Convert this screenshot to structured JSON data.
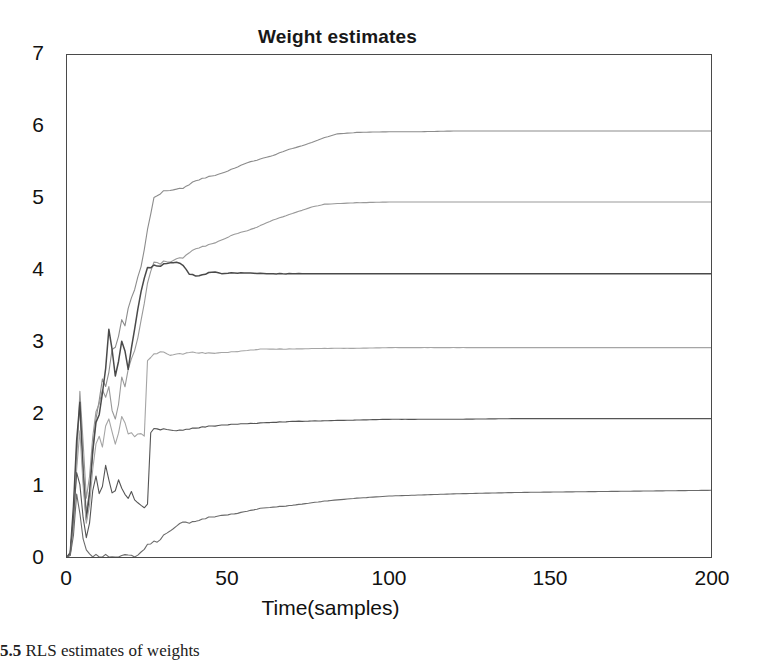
{
  "figure": {
    "caption_number": "5.5",
    "caption_text": "RLS estimates of weights"
  },
  "chart_data": {
    "type": "line",
    "title": "Weight estimates",
    "xlabel": "Time(samples)",
    "ylabel": "",
    "xlim": [
      0,
      200
    ],
    "ylim": [
      0,
      7
    ],
    "xticks": [
      0,
      50,
      100,
      150,
      200
    ],
    "xtick_labels": [
      "0",
      "50",
      "100",
      "150",
      "200"
    ],
    "yticks": [
      0,
      1,
      2,
      3,
      4,
      5,
      6,
      7
    ],
    "ytick_labels": [
      "0",
      "1",
      "2",
      "3",
      "4",
      "5",
      "6",
      "7"
    ],
    "grid": false,
    "legend": false,
    "legend_position": "none",
    "series": [
      {
        "name": "w1",
        "color": "#8c8c8c",
        "final_value": 5.94,
        "x": [
          0,
          1,
          2,
          3,
          4,
          5,
          6,
          7,
          8,
          9,
          10,
          11,
          12,
          13,
          14,
          15,
          16,
          17,
          18,
          19,
          20,
          21,
          22,
          23,
          24,
          25,
          26,
          27,
          28,
          29,
          30,
          32,
          34,
          36,
          38,
          40,
          44,
          48,
          52,
          56,
          60,
          64,
          68,
          72,
          76,
          80,
          84,
          90,
          100,
          110,
          120,
          130,
          140,
          150,
          160,
          170,
          180,
          190,
          200
        ],
        "y": [
          0,
          0.05,
          0.6,
          1.5,
          2.1,
          1.3,
          0.6,
          0.9,
          1.5,
          1.9,
          2.2,
          2.5,
          2.35,
          2.6,
          2.9,
          2.95,
          3.1,
          3.3,
          3.2,
          3.45,
          3.6,
          3.75,
          3.9,
          4.05,
          4.3,
          4.55,
          4.8,
          5.0,
          5.05,
          5.08,
          5.1,
          5.1,
          5.12,
          5.15,
          5.2,
          5.25,
          5.3,
          5.35,
          5.42,
          5.5,
          5.55,
          5.6,
          5.67,
          5.72,
          5.78,
          5.85,
          5.9,
          5.92,
          5.93,
          5.93,
          5.94,
          5.94,
          5.94,
          5.94,
          5.94,
          5.94,
          5.94,
          5.94,
          5.94
        ]
      },
      {
        "name": "w2",
        "color": "#999999",
        "final_value": 4.95,
        "x": [
          0,
          1,
          2,
          3,
          4,
          5,
          6,
          7,
          8,
          9,
          10,
          11,
          12,
          13,
          14,
          15,
          16,
          17,
          18,
          19,
          20,
          21,
          22,
          23,
          24,
          25,
          26,
          27,
          28,
          29,
          30,
          32,
          34,
          36,
          38,
          40,
          44,
          48,
          52,
          56,
          60,
          64,
          68,
          72,
          76,
          80,
          90,
          100,
          120,
          140,
          160,
          180,
          200
        ],
        "y": [
          0,
          0.04,
          0.5,
          1.3,
          2.3,
          1.6,
          0.8,
          1.1,
          1.7,
          2.0,
          2.15,
          2.35,
          2.2,
          2.4,
          2.05,
          1.95,
          2.15,
          2.5,
          2.35,
          2.6,
          2.75,
          2.9,
          3.05,
          3.3,
          3.55,
          3.8,
          4.0,
          4.1,
          4.12,
          4.1,
          4.12,
          4.1,
          4.15,
          4.18,
          4.25,
          4.3,
          4.35,
          4.42,
          4.5,
          4.55,
          4.62,
          4.7,
          4.76,
          4.82,
          4.88,
          4.92,
          4.94,
          4.95,
          4.95,
          4.95,
          4.95,
          4.95,
          4.95
        ]
      },
      {
        "name": "w3",
        "color": "#4a4a4a",
        "final_value": 3.95,
        "x": [
          0,
          1,
          2,
          3,
          4,
          5,
          6,
          7,
          8,
          9,
          10,
          11,
          12,
          13,
          14,
          15,
          16,
          17,
          18,
          19,
          20,
          21,
          22,
          23,
          24,
          25,
          26,
          27,
          28,
          29,
          30,
          32,
          34,
          36,
          38,
          40,
          42,
          44,
          46,
          48,
          50,
          54,
          58,
          62,
          66,
          70,
          80,
          90,
          100,
          120,
          140,
          160,
          180,
          200
        ],
        "y": [
          0,
          0.06,
          0.7,
          1.6,
          2.15,
          1.15,
          0.5,
          0.85,
          1.5,
          1.85,
          2.0,
          2.3,
          2.6,
          3.2,
          2.9,
          2.55,
          2.75,
          3.0,
          2.85,
          2.6,
          2.9,
          3.2,
          3.45,
          3.7,
          3.9,
          4.02,
          4.05,
          4.06,
          4.07,
          4.07,
          4.08,
          4.09,
          4.1,
          4.08,
          3.95,
          3.92,
          3.93,
          3.96,
          3.98,
          3.95,
          3.96,
          3.96,
          3.96,
          3.95,
          3.95,
          3.95,
          3.95,
          3.95,
          3.95,
          3.95,
          3.95,
          3.95,
          3.95,
          3.95
        ]
      },
      {
        "name": "w4",
        "color": "#a5a5a5",
        "final_value": 2.92,
        "x": [
          0,
          1,
          2,
          3,
          4,
          5,
          6,
          7,
          8,
          9,
          10,
          11,
          12,
          13,
          14,
          15,
          16,
          17,
          18,
          19,
          20,
          21,
          22,
          23,
          24,
          25,
          26,
          27,
          28,
          29,
          30,
          32,
          34,
          36,
          38,
          40,
          44,
          48,
          52,
          56,
          60,
          70,
          80,
          90,
          100,
          120,
          140,
          160,
          180,
          200
        ],
        "y": [
          0,
          0.03,
          0.45,
          1.2,
          1.75,
          1.0,
          0.45,
          0.7,
          1.25,
          1.55,
          1.7,
          1.55,
          1.8,
          1.95,
          1.75,
          1.6,
          1.75,
          1.95,
          1.85,
          1.7,
          1.72,
          1.7,
          1.71,
          1.72,
          1.7,
          2.72,
          2.8,
          2.82,
          2.85,
          2.88,
          2.85,
          2.8,
          2.82,
          2.84,
          2.86,
          2.85,
          2.84,
          2.85,
          2.86,
          2.88,
          2.9,
          2.9,
          2.91,
          2.91,
          2.92,
          2.92,
          2.92,
          2.92,
          2.92,
          2.92
        ]
      },
      {
        "name": "w5",
        "color": "#555555",
        "final_value": 1.93,
        "x": [
          0,
          1,
          2,
          3,
          4,
          5,
          6,
          7,
          8,
          9,
          10,
          11,
          12,
          13,
          14,
          15,
          16,
          17,
          18,
          19,
          20,
          21,
          22,
          23,
          24,
          25,
          26,
          27,
          28,
          30,
          32,
          34,
          36,
          40,
          44,
          48,
          52,
          56,
          60,
          70,
          80,
          90,
          100,
          120,
          140,
          160,
          180,
          200
        ],
        "y": [
          0,
          0.05,
          0.55,
          1.15,
          1.0,
          0.55,
          0.25,
          0.45,
          0.95,
          1.1,
          0.9,
          1.0,
          1.25,
          1.1,
          0.9,
          0.95,
          1.1,
          0.95,
          0.85,
          0.8,
          0.9,
          0.82,
          0.75,
          0.72,
          0.7,
          0.72,
          1.75,
          1.78,
          1.8,
          1.78,
          1.76,
          1.75,
          1.78,
          1.8,
          1.82,
          1.84,
          1.85,
          1.86,
          1.87,
          1.89,
          1.9,
          1.91,
          1.92,
          1.92,
          1.93,
          1.93,
          1.93,
          1.93
        ]
      },
      {
        "name": "w6",
        "color": "#6b6b6b",
        "final_value": 0.93,
        "x": [
          0,
          1,
          2,
          3,
          4,
          5,
          6,
          7,
          8,
          9,
          10,
          12,
          14,
          16,
          18,
          20,
          22,
          24,
          26,
          28,
          30,
          32,
          34,
          36,
          38,
          40,
          44,
          48,
          52,
          56,
          60,
          70,
          80,
          90,
          100,
          120,
          140,
          160,
          180,
          200
        ],
        "y": [
          0,
          0.02,
          0.3,
          0.85,
          0.6,
          0.25,
          0.08,
          0.02,
          0.01,
          0.01,
          0.01,
          0.01,
          0.01,
          0.01,
          0.01,
          0.01,
          0.02,
          0.12,
          0.2,
          0.22,
          0.3,
          0.35,
          0.42,
          0.5,
          0.48,
          0.5,
          0.55,
          0.58,
          0.6,
          0.64,
          0.68,
          0.72,
          0.78,
          0.82,
          0.85,
          0.88,
          0.9,
          0.91,
          0.92,
          0.93
        ]
      }
    ]
  }
}
